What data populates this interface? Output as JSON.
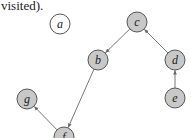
{
  "caption": "visited).",
  "colors": {
    "visited_fill": "#c8c8c8",
    "unvisited_fill": "#ffffff",
    "stroke": "#555555",
    "edge": "#666666"
  },
  "nodes": [
    {
      "id": "a",
      "label": "a",
      "x": 60,
      "y": 24,
      "visited": false
    },
    {
      "id": "c",
      "label": "c",
      "x": 137,
      "y": 22,
      "visited": true
    },
    {
      "id": "b",
      "label": "b",
      "x": 98,
      "y": 60,
      "visited": true
    },
    {
      "id": "d",
      "label": "d",
      "x": 175,
      "y": 60,
      "visited": true
    },
    {
      "id": "e",
      "label": "e",
      "x": 175,
      "y": 98,
      "visited": true
    },
    {
      "id": "g",
      "label": "g",
      "x": 27,
      "y": 99,
      "visited": true
    },
    {
      "id": "f",
      "label": "f",
      "x": 64,
      "y": 137,
      "visited": true
    }
  ],
  "edges": [
    {
      "from": "c",
      "to": "b"
    },
    {
      "from": "d",
      "to": "c"
    },
    {
      "from": "e",
      "to": "d"
    },
    {
      "from": "b",
      "to": "f"
    },
    {
      "from": "f",
      "to": "g"
    }
  ]
}
